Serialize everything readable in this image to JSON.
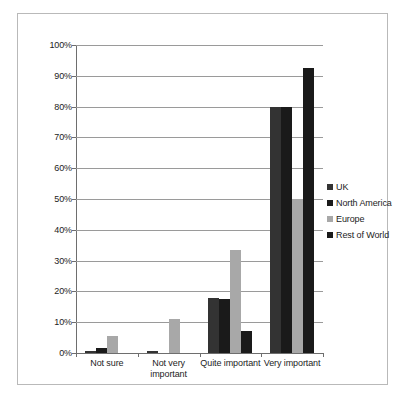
{
  "chart_data": {
    "type": "bar",
    "title": "",
    "subtitle": "",
    "xlabel": "",
    "ylabel": "",
    "categories": [
      "Not sure",
      "Not very important",
      "Quite important",
      "Very important"
    ],
    "series": [
      {
        "name": "UK",
        "color": "#333333",
        "values": [
          0.5,
          0.7,
          18.0,
          80.0
        ]
      },
      {
        "name": "North America",
        "color": "#1a1a1a",
        "values": [
          1.5,
          0.0,
          17.5,
          80.0
        ]
      },
      {
        "name": "Europe",
        "color": "#a8a8a8",
        "values": [
          5.5,
          11.0,
          33.5,
          50.0
        ]
      },
      {
        "name": "Rest of World",
        "color": "#1a1a1a",
        "values": [
          0.0,
          0.0,
          7.0,
          92.5
        ]
      }
    ],
    "ylim": [
      0,
      100
    ],
    "ytick_step": 10,
    "ytick_labels": [
      "100%",
      "90%",
      "80%",
      "70%",
      "60%",
      "50%",
      "40%",
      "30%",
      "20%",
      "10%",
      "0%"
    ],
    "ytick_values": [
      100,
      90,
      80,
      70,
      60,
      50,
      40,
      30,
      20,
      10,
      0
    ],
    "grid": true,
    "grid_axis": "y",
    "legend_position": "right",
    "legend_entries": [
      "UK",
      "North America",
      "Europe",
      "Rest of World"
    ],
    "category_label_lines": [
      [
        "Not sure"
      ],
      [
        "Not very",
        "important"
      ],
      [
        "Quite important"
      ],
      [
        "Very important"
      ]
    ]
  },
  "frame": {
    "border_color": "#b9b9b9",
    "background": "#ffffff"
  }
}
